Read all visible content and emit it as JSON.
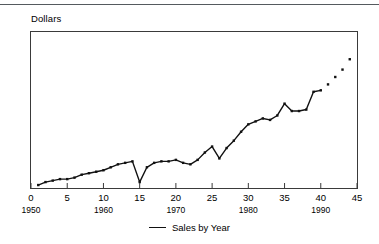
{
  "figure": {
    "top_rule_color": "#555a5e",
    "frame_color": "#3a3a3a",
    "line_color": "#111111",
    "marker_color": "#111111"
  },
  "axis_title": "Dollars",
  "legend": {
    "series_label": "Sales by Year",
    "position": "bottom-center"
  },
  "chart_data": {
    "type": "line",
    "title": "",
    "subtitle": "",
    "xlabel": "",
    "ylabel": "Dollars",
    "xlim": [
      0,
      45
    ],
    "ylim": [
      0,
      100
    ],
    "grid": false,
    "legend_position": "bottom-center",
    "xticks": [
      0,
      5,
      10,
      15,
      20,
      25,
      30,
      35,
      40,
      45
    ],
    "xticklabels": [
      "0",
      "5",
      "10",
      "15",
      "20",
      "25",
      "30",
      "35",
      "40",
      "45"
    ],
    "x_secondary_ticks": [
      0,
      10,
      20,
      30,
      40
    ],
    "x_secondary_labels": [
      "1950",
      "1960",
      "1970",
      "1980",
      "1990"
    ],
    "yticks": [],
    "yticklabels": [],
    "annotations": [
      "Line stops at x=40; markers continue alone from x=41 to x=44",
      "Detached low marker at x=26 sits below the connecting line",
      "Sharp V-shaped dip at x=15"
    ],
    "series": [
      {
        "name": "Sales by Year",
        "marker": "square-dot",
        "line_end_x": 40,
        "x": [
          1,
          2,
          3,
          4,
          5,
          6,
          7,
          8,
          9,
          10,
          11,
          12,
          13,
          14,
          15,
          16,
          17,
          18,
          19,
          20,
          21,
          22,
          23,
          24,
          25,
          26,
          27,
          28,
          29,
          30,
          31,
          32,
          33,
          34,
          35,
          36,
          37,
          38,
          39,
          40,
          41,
          42,
          43,
          44
        ],
        "values": [
          2,
          4,
          5,
          6,
          6,
          7,
          9,
          10,
          11,
          12,
          14,
          16,
          17,
          18,
          4,
          14,
          17,
          18,
          18,
          19,
          17,
          16,
          19,
          24,
          28,
          20,
          27,
          32,
          38,
          43,
          45,
          47,
          46,
          49,
          57,
          52,
          52,
          53,
          65,
          66,
          70,
          75,
          80,
          87
        ]
      }
    ]
  }
}
